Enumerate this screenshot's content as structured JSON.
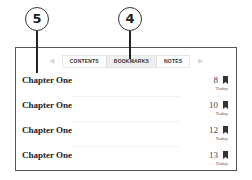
{
  "callouts": [
    {
      "label": "5",
      "target": "chapter-title"
    },
    {
      "label": "4",
      "target": "bookmarks-tab"
    }
  ],
  "tabs": [
    {
      "label": "CONTENTS",
      "active": false
    },
    {
      "label": "BOOKMARKS",
      "active": true
    },
    {
      "label": "NOTES",
      "active": false
    }
  ],
  "arrows": {
    "left": "◀",
    "right": "▶"
  },
  "bookmarks": [
    {
      "title": "Chapter One",
      "page": "8",
      "date": "Today",
      "icon": "bookmark-icon"
    },
    {
      "title": "Chapter One",
      "page": "10",
      "date": "Today",
      "icon": "bookmark-icon"
    },
    {
      "title": "Chapter One",
      "page": "12",
      "date": "Today",
      "icon": "bookmark-icon"
    },
    {
      "title": "Chapter One",
      "page": "13",
      "date": "Today",
      "icon": "bookmark-icon"
    }
  ]
}
